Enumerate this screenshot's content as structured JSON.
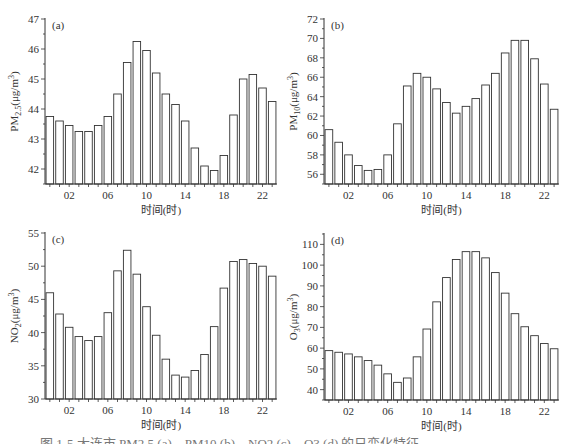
{
  "chart_data": [
    {
      "type": "bar",
      "panel_label": "(a)",
      "title": "",
      "xlabel": "时间(时)",
      "ylabel": "PM2.5(μg/m³)",
      "ylabel_main": "PM",
      "ylabel_sub": "2.5",
      "ylabel_unit": "(μg/m",
      "ylabel_sup": "3",
      "ylim": [
        41.5,
        47
      ],
      "yticks": [
        42,
        43,
        44,
        45,
        46,
        47
      ],
      "xtick_labels": [
        "02",
        "06",
        "10",
        "14",
        "18",
        "22"
      ],
      "categories": [
        "00",
        "01",
        "02",
        "03",
        "04",
        "05",
        "06",
        "07",
        "08",
        "09",
        "10",
        "11",
        "12",
        "13",
        "14",
        "15",
        "16",
        "17",
        "18",
        "19",
        "20",
        "21",
        "22",
        "23"
      ],
      "values": [
        43.75,
        43.6,
        43.45,
        43.25,
        43.25,
        43.45,
        43.75,
        44.5,
        45.55,
        46.25,
        45.95,
        45.2,
        44.5,
        44.15,
        43.6,
        42.7,
        42.1,
        41.95,
        42.45,
        43.8,
        45.0,
        45.15,
        44.7,
        44.25
      ],
      "grid": false,
      "legend": null
    },
    {
      "type": "bar",
      "panel_label": "(b)",
      "title": "",
      "xlabel": "时间(时)",
      "ylabel": "PM10(μg/m³)",
      "ylabel_main": "PM",
      "ylabel_sub": "10",
      "ylabel_unit": "(μg/m",
      "ylabel_sup": "3",
      "ylim": [
        55,
        72
      ],
      "yticks": [
        56,
        58,
        60,
        62,
        64,
        66,
        68,
        70,
        72
      ],
      "xtick_labels": [
        "02",
        "06",
        "10",
        "14",
        "18",
        "22"
      ],
      "categories": [
        "00",
        "01",
        "02",
        "03",
        "04",
        "05",
        "06",
        "07",
        "08",
        "09",
        "10",
        "11",
        "12",
        "13",
        "14",
        "15",
        "16",
        "17",
        "18",
        "19",
        "20",
        "21",
        "22",
        "23"
      ],
      "values": [
        60.6,
        59.3,
        58.0,
        56.9,
        56.4,
        56.5,
        58.0,
        61.2,
        65.1,
        66.4,
        66.0,
        64.8,
        63.4,
        62.3,
        63.0,
        63.8,
        65.2,
        66.4,
        68.5,
        69.8,
        69.8,
        67.9,
        65.3,
        62.7
      ],
      "grid": false,
      "legend": null
    },
    {
      "type": "bar",
      "panel_label": "(c)",
      "title": "",
      "xlabel": "时间(时)",
      "ylabel": "NO2(μg/m³)",
      "ylabel_main": "NO",
      "ylabel_sub": "2",
      "ylabel_unit": "(μg/m",
      "ylabel_sup": "3",
      "ylim": [
        30,
        55
      ],
      "yticks": [
        30,
        35,
        40,
        45,
        50,
        55
      ],
      "xtick_labels": [
        "02",
        "06",
        "10",
        "14",
        "18",
        "22"
      ],
      "categories": [
        "00",
        "01",
        "02",
        "03",
        "04",
        "05",
        "06",
        "07",
        "08",
        "09",
        "10",
        "11",
        "12",
        "13",
        "14",
        "15",
        "16",
        "17",
        "18",
        "19",
        "20",
        "21",
        "22",
        "23"
      ],
      "values": [
        46.0,
        42.8,
        40.8,
        39.4,
        38.8,
        39.4,
        43.0,
        49.3,
        52.4,
        48.8,
        43.9,
        39.6,
        36.0,
        33.6,
        33.3,
        34.3,
        36.7,
        40.9,
        46.7,
        50.7,
        51.0,
        50.4,
        50.0,
        48.5
      ],
      "grid": false,
      "legend": null
    },
    {
      "type": "bar",
      "panel_label": "(d)",
      "title": "",
      "xlabel": "时间(时)",
      "ylabel": "O3(μg/m³)",
      "ylabel_main": "O",
      "ylabel_sub": "3",
      "ylabel_unit": "(μg/m",
      "ylabel_sup": "3",
      "ylim": [
        35,
        115
      ],
      "yticks": [
        40,
        50,
        60,
        70,
        80,
        90,
        100,
        110
      ],
      "xtick_labels": [
        "02",
        "06",
        "10",
        "14",
        "18",
        "22"
      ],
      "categories": [
        "00",
        "01",
        "02",
        "03",
        "04",
        "05",
        "06",
        "07",
        "08",
        "09",
        "10",
        "11",
        "12",
        "13",
        "14",
        "15",
        "16",
        "17",
        "18",
        "19",
        "20",
        "21",
        "22",
        "23"
      ],
      "values": [
        58.8,
        58.0,
        57.2,
        55.8,
        54.0,
        51.8,
        47.6,
        43.5,
        45.6,
        55.8,
        69.2,
        82.3,
        94.0,
        102.7,
        106.5,
        106.5,
        103.5,
        96.4,
        86.5,
        76.6,
        70.3,
        66.0,
        62.2,
        59.7
      ],
      "grid": false,
      "legend": null
    }
  ],
  "caption": "图 1-5  大连市 PM2.5 (a)、PM10 (b)、NO2 (c)、O3 (d) 的日变化特征",
  "colors": {
    "bar_fill": "#ffffff",
    "bar_stroke": "#333333",
    "axis": "#333333",
    "text": "#333333"
  }
}
